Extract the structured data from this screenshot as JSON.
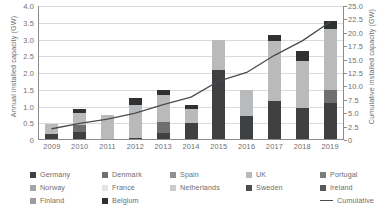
{
  "chart_data": {
    "type": "bar",
    "title": "",
    "subtitle": "",
    "stacked": true,
    "grid": true,
    "legend_position": "bottom",
    "xlabel": "",
    "ylabel": "Annual installed capacity (GW)",
    "y2label": "Cumulative installed capacity (GW)",
    "ylim": [
      0,
      4.0
    ],
    "y2lim": [
      0,
      25.0
    ],
    "categories": [
      "2009",
      "2010",
      "2011",
      "2012",
      "2013",
      "2014",
      "2015",
      "2016",
      "2017",
      "2018",
      "2019"
    ],
    "yticks": [
      "0",
      "0.5",
      "1.0",
      "1.5",
      "2.0",
      "2.5",
      "3.0",
      "3.5",
      "4.0"
    ],
    "y2ticks": [
      "0",
      "2.5",
      "5.0",
      "7.5",
      "10.0",
      "12.5",
      "15.0",
      "17.5",
      "20.0",
      "22.5",
      "25.0"
    ],
    "series": [
      {
        "name": "Germany",
        "color": "#3f4042",
        "values": [
          0.18,
          0.25,
          0.04,
          0.06,
          0.22,
          0.52,
          2.1,
          0.72,
          1.15,
          0.95,
          1.1
        ]
      },
      {
        "name": "Denmark",
        "color": "#6e6f71",
        "values": [
          0.0,
          0.21,
          0.0,
          0.0,
          0.33,
          0.0,
          0.0,
          0.0,
          0.0,
          0.0,
          0.4
        ]
      },
      {
        "name": "Spain",
        "color": "#8e9092",
        "values": [
          0.0,
          0.0,
          0.0,
          0.0,
          0.0,
          0.0,
          0.0,
          0.0,
          0.0,
          0.0,
          0.0
        ]
      },
      {
        "name": "UK",
        "color": "#b8babc",
        "values": [
          0.3,
          0.34,
          0.7,
          1.0,
          0.8,
          0.4,
          0.9,
          0.78,
          1.8,
          1.4,
          1.8
        ]
      },
      {
        "name": "Portugal",
        "color": "#7a7c7e",
        "values": [
          0.0,
          0.0,
          0.0,
          0.0,
          0.0,
          0.0,
          0.0,
          0.0,
          0.0,
          0.0,
          0.0
        ]
      },
      {
        "name": "Norway",
        "color": "#a2a4a6",
        "values": [
          0.0,
          0.0,
          0.0,
          0.0,
          0.0,
          0.0,
          0.0,
          0.0,
          0.0,
          0.0,
          0.0
        ]
      },
      {
        "name": "France",
        "color": "#e3e4e5",
        "values": [
          0.0,
          0.0,
          0.0,
          0.0,
          0.0,
          0.0,
          0.0,
          0.0,
          0.0,
          0.0,
          0.0
        ]
      },
      {
        "name": "Netherlands",
        "color": "#c8cacc",
        "values": [
          0.0,
          0.0,
          0.0,
          0.0,
          0.0,
          0.0,
          0.0,
          0.0,
          0.0,
          0.0,
          0.0
        ]
      },
      {
        "name": "Sweden",
        "color": "#4d4e50",
        "values": [
          0.0,
          0.0,
          0.0,
          0.0,
          0.0,
          0.0,
          0.0,
          0.0,
          0.0,
          0.0,
          0.0
        ]
      },
      {
        "name": "Ireland",
        "color": "#58595b",
        "values": [
          0.0,
          0.0,
          0.0,
          0.0,
          0.0,
          0.0,
          0.0,
          0.0,
          0.0,
          0.0,
          0.0
        ]
      },
      {
        "name": "Finland",
        "color": "#9b9d9f",
        "values": [
          0.0,
          0.0,
          0.0,
          0.0,
          0.0,
          0.0,
          0.0,
          0.0,
          0.0,
          0.0,
          0.0
        ]
      },
      {
        "name": "Belgium",
        "color": "#303133",
        "values": [
          0.0,
          0.12,
          0.0,
          0.18,
          0.15,
          0.14,
          0.0,
          0.0,
          0.2,
          0.3,
          0.25
        ]
      }
    ],
    "cumulative": {
      "name": "Cumulative",
      "color": "#4a4b4d",
      "unit": "GW",
      "values": [
        2.1,
        3.1,
        3.9,
        5.0,
        6.6,
        8.0,
        11.0,
        12.6,
        15.8,
        18.5,
        22.0
      ]
    }
  },
  "legend": {
    "entries": [
      {
        "label": "Germany",
        "color": "#3f4042",
        "row": 0,
        "col": 0
      },
      {
        "label": "Denmark",
        "color": "#6e6f71",
        "row": 0,
        "col": 1
      },
      {
        "label": "Spain",
        "color": "#8e9092",
        "row": 0,
        "col": 2
      },
      {
        "label": "UK",
        "color": "#b8babc",
        "row": 0,
        "col": 3
      },
      {
        "label": "Portugal",
        "color": "#7a7c7e",
        "row": 0,
        "col": 4
      },
      {
        "label": "Norway",
        "color": "#a2a4a6",
        "row": 1,
        "col": 0
      },
      {
        "label": "France",
        "color": "#e3e4e5",
        "row": 1,
        "col": 1
      },
      {
        "label": "Netherlands",
        "color": "#c8cacc",
        "row": 1,
        "col": 2
      },
      {
        "label": "Sweden",
        "color": "#4d4e50",
        "row": 1,
        "col": 3
      },
      {
        "label": "Ireland",
        "color": "#58595b",
        "row": 1,
        "col": 4
      },
      {
        "label": "Finland",
        "color": "#9b9d9f",
        "row": 2,
        "col": 0
      },
      {
        "label": "Belgium",
        "color": "#303133",
        "row": 2,
        "col": 1
      }
    ],
    "line_entry": {
      "label": "Cumulative",
      "color": "#4a4b4d",
      "row": 2,
      "col": 4
    }
  }
}
